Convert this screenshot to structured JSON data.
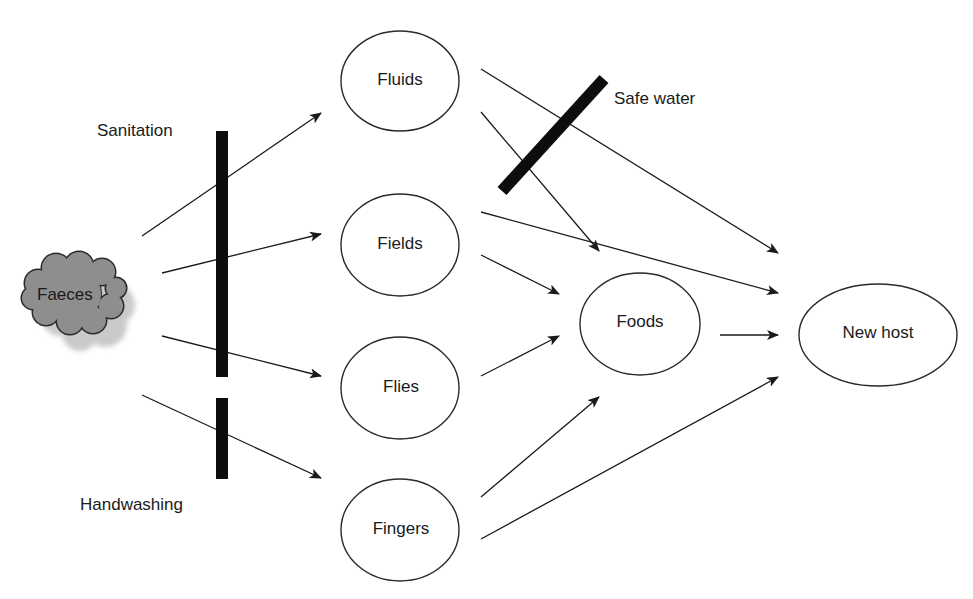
{
  "diagram": {
    "type": "F-diagram (faecal-oral transmission routes)",
    "source": {
      "id": "faeces",
      "label": "Faeces",
      "shape": "cloud",
      "fill": "#8c8c8c"
    },
    "nodes": [
      {
        "id": "fluids",
        "label": "Fluids"
      },
      {
        "id": "fields",
        "label": "Fields"
      },
      {
        "id": "flies",
        "label": "Flies"
      },
      {
        "id": "fingers",
        "label": "Fingers"
      },
      {
        "id": "foods",
        "label": "Foods"
      },
      {
        "id": "new_host",
        "label": "New host"
      }
    ],
    "barriers": [
      {
        "id": "sanitation",
        "label": "Sanitation",
        "blocks": [
          "faeces->fluids",
          "faeces->fields",
          "faeces->flies"
        ]
      },
      {
        "id": "handwashing",
        "label": "Handwashing",
        "blocks": [
          "faeces->fingers"
        ]
      },
      {
        "id": "safe_water",
        "label": "Safe water",
        "blocks": [
          "fluids->new_host",
          "fluids->foods"
        ]
      }
    ],
    "edges": [
      {
        "from": "faeces",
        "to": "fluids"
      },
      {
        "from": "faeces",
        "to": "fields"
      },
      {
        "from": "faeces",
        "to": "flies"
      },
      {
        "from": "faeces",
        "to": "fingers"
      },
      {
        "from": "fluids",
        "to": "new_host"
      },
      {
        "from": "fluids",
        "to": "foods"
      },
      {
        "from": "fields",
        "to": "new_host"
      },
      {
        "from": "fields",
        "to": "foods"
      },
      {
        "from": "flies",
        "to": "foods"
      },
      {
        "from": "fingers",
        "to": "foods"
      },
      {
        "from": "fingers",
        "to": "new_host"
      },
      {
        "from": "foods",
        "to": "new_host"
      }
    ]
  },
  "labels": {
    "faeces": "Faeces",
    "fluids": "Fluids",
    "fields": "Fields",
    "flies": "Flies",
    "fingers": "Fingers",
    "foods": "Foods",
    "new_host": "New host",
    "sanitation": "Sanitation",
    "handwashing": "Handwashing",
    "safe_water": "Safe water"
  }
}
